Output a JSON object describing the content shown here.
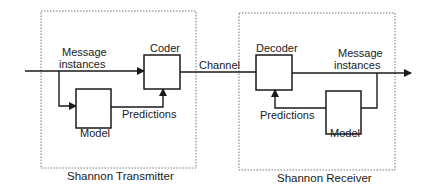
{
  "diagram": {
    "type": "block-diagram",
    "transmitter": {
      "label": "Shannon Transmitter",
      "input_label_line1": "Message",
      "input_label_line2": "instances",
      "coder_label": "Coder",
      "model_label": "Model",
      "predictions_label": "Predictions"
    },
    "channel": {
      "label": "Channel"
    },
    "receiver": {
      "label": "Shannon Receiver",
      "decoder_label": "Decoder",
      "output_label_line1": "Message",
      "output_label_line2": "instances",
      "model_label": "Model",
      "predictions_label": "Predictions"
    },
    "colors": {
      "line": "#1a1a1a",
      "dotted_border": "#777777",
      "background": "#ffffff"
    }
  }
}
